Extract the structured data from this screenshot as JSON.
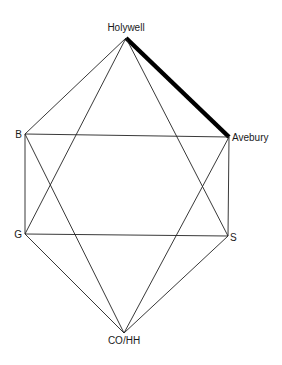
{
  "diagram": {
    "type": "network-graph",
    "nodes": [
      {
        "id": "holywell",
        "label": "Holywell",
        "x": 126,
        "y": 38,
        "label_x": 126,
        "label_y": 31,
        "anchor": "middle"
      },
      {
        "id": "b",
        "label": "B",
        "x": 25,
        "y": 134,
        "label_x": 22,
        "label_y": 138,
        "anchor": "end"
      },
      {
        "id": "avebury",
        "label": "Avebury",
        "x": 229,
        "y": 137,
        "label_x": 232,
        "label_y": 141,
        "anchor": "start"
      },
      {
        "id": "g",
        "label": "G",
        "x": 25,
        "y": 234,
        "label_x": 22,
        "label_y": 238,
        "anchor": "end"
      },
      {
        "id": "s",
        "label": "S",
        "x": 228,
        "y": 236,
        "label_x": 230,
        "label_y": 241,
        "anchor": "start"
      },
      {
        "id": "cohh",
        "label": "CO/HH",
        "x": 124,
        "y": 333,
        "label_x": 124,
        "label_y": 344,
        "anchor": "middle"
      }
    ],
    "edges": [
      {
        "from": "holywell",
        "to": "avebury",
        "emphasis": "thick"
      },
      {
        "from": "holywell",
        "to": "b",
        "emphasis": "normal"
      },
      {
        "from": "holywell",
        "to": "g",
        "emphasis": "normal"
      },
      {
        "from": "holywell",
        "to": "s",
        "emphasis": "normal"
      },
      {
        "from": "b",
        "to": "avebury",
        "emphasis": "normal"
      },
      {
        "from": "b",
        "to": "g",
        "emphasis": "normal"
      },
      {
        "from": "b",
        "to": "cohh",
        "emphasis": "normal"
      },
      {
        "from": "avebury",
        "to": "s",
        "emphasis": "normal"
      },
      {
        "from": "avebury",
        "to": "cohh",
        "emphasis": "normal"
      },
      {
        "from": "g",
        "to": "s",
        "emphasis": "normal"
      },
      {
        "from": "g",
        "to": "cohh",
        "emphasis": "normal"
      },
      {
        "from": "s",
        "to": "cohh",
        "emphasis": "normal"
      }
    ]
  }
}
